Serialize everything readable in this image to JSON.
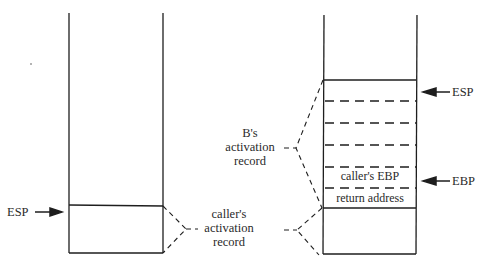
{
  "diagram": {
    "left_stack": {
      "register_label": "ESP",
      "record_label": [
        "caller's",
        "activation",
        "record"
      ]
    },
    "right_stack": {
      "esp_label": "ESP",
      "ebp_label": "EBP",
      "cells": [
        "",
        "",
        "",
        "",
        "caller's EBP",
        "return address"
      ],
      "b_record_label": [
        "B's",
        "activation",
        "record"
      ],
      "caller_record_label": [
        "caller's",
        "activation",
        "record"
      ]
    },
    "colors": {
      "line": "#1e1e1e",
      "background": "#ffffff"
    }
  }
}
